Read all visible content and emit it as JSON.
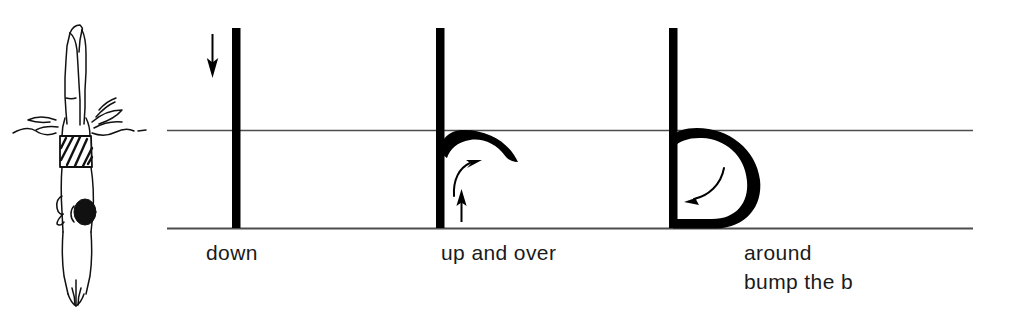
{
  "page": {
    "background_color": "#ffffff",
    "ink_color": "#000000",
    "guideline_color": "#4d4d4d",
    "text_color": "#1a1a1a",
    "width": 1014,
    "height": 318
  },
  "illustration": {
    "name": "diver-entering-water",
    "description": "Line drawing of a diver entering the water head first, arms at sides, striped swim trunks, splash at the waterline",
    "alt_text": "diver",
    "line_color": "#111111"
  },
  "guidelines": {
    "midline_label": "midline",
    "baseline_label": "baseline",
    "midline_y": 130,
    "baseline_y": 228,
    "start_x": 167,
    "end_x": 973
  },
  "steps": [
    {
      "id": "step-1",
      "label": "down",
      "letter_part": "stem",
      "arrow": "down-arrow",
      "arrow_direction": "down",
      "stem_x": 236,
      "top_y": 28,
      "bottom_y": 228
    },
    {
      "id": "step-2",
      "label": "up and over",
      "letter_part": "stem-plus-hook",
      "arrow": "up-arrow",
      "arrow_direction": "up",
      "second_arrow": "curved-arrow-over",
      "arrow_direction_2": "curve-right",
      "stem_x": 440,
      "top_y": 28,
      "bottom_y": 228
    },
    {
      "id": "step-3",
      "label": "around\nbump the b",
      "label_line_1": "around",
      "label_line_2": "bump the b",
      "letter_part": "complete-b",
      "arrow": "curved-arrow-around",
      "arrow_direction": "curve-down-left",
      "stem_x": 673,
      "top_y": 28,
      "bottom_y": 228
    }
  ],
  "labels": {
    "step_1": "down",
    "step_2": "up and over",
    "step_3_line_1": "around",
    "step_3_line_2": "bump the b"
  }
}
